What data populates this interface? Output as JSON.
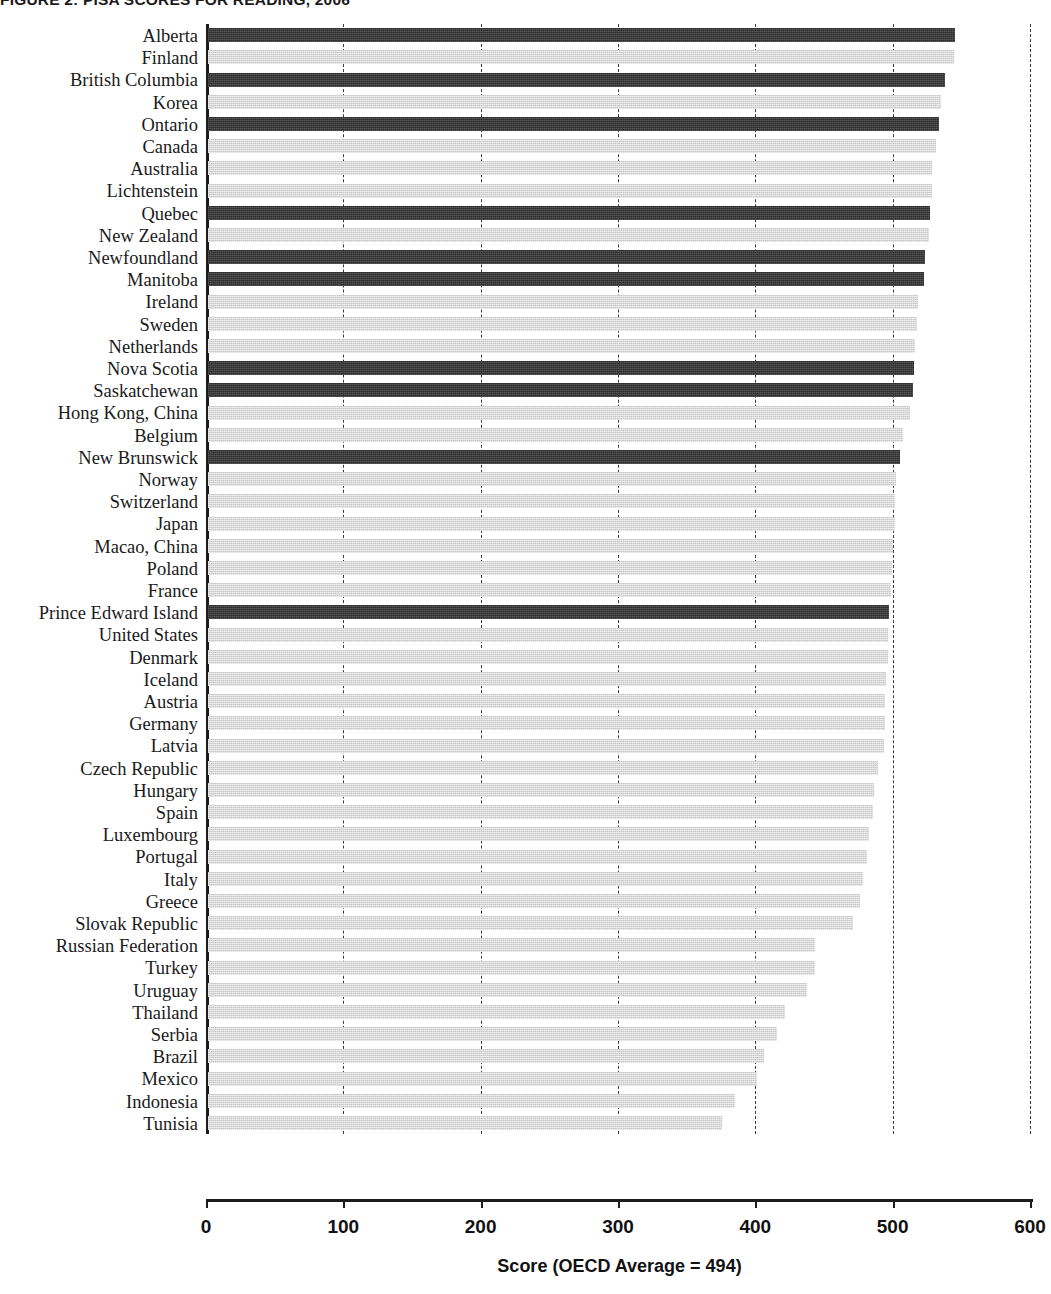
{
  "figure": {
    "title": "FIGURE 2: PISA SCORES FOR READING, 2006"
  },
  "axis": {
    "x_title": "Score (OECD Average = 494)",
    "tick_labels": [
      "0",
      "100",
      "200",
      "300",
      "400",
      "500",
      "600"
    ]
  },
  "legend": {
    "dark_series_name": "Canadian provinces",
    "light_series_name": "Countries / economies",
    "dark_color": "#2c2c2c",
    "light_color": "#c6c6c6"
  },
  "chart_data": {
    "type": "bar",
    "orientation": "horizontal",
    "title": "FIGURE 2: PISA SCORES FOR READING, 2006",
    "xlabel": "Score (OECD Average = 494)",
    "ylabel": "",
    "xlim": [
      0,
      600
    ],
    "xticks": [
      0,
      100,
      200,
      300,
      400,
      500,
      600
    ],
    "grid": true,
    "grid_axis": "x",
    "grid_style": "dashed",
    "legend_position": "none",
    "reference_value": 494,
    "reference_label": "OECD Average = 494",
    "categories": [
      "Alberta",
      "Finland",
      "British Columbia",
      "Korea",
      "Ontario",
      "Canada",
      "Australia",
      "Lichtenstein",
      "Quebec",
      "New Zealand",
      "Newfoundland",
      "Manitoba",
      "Ireland",
      "Sweden",
      "Netherlands",
      "Nova Scotia",
      "Saskatchewan",
      "Hong Kong, China",
      "Belgium",
      "New Brunswick",
      "Norway",
      "Switzerland",
      "Japan",
      "Macao, China",
      "Poland",
      "France",
      "Prince Edward Island",
      "United States",
      "Denmark",
      "Iceland",
      "Austria",
      "Germany",
      "Latvia",
      "Czech Republic",
      "Hungary",
      "Spain",
      "Luxembourg",
      "Portugal",
      "Italy",
      "Greece",
      "Slovak Republic",
      "Russian Federation",
      "Turkey",
      "Uruguay",
      "Thailand",
      "Serbia",
      "Brazil",
      "Mexico",
      "Indonesia",
      "Tunisia"
    ],
    "values": [
      544,
      543,
      537,
      534,
      532,
      530,
      527,
      527,
      526,
      525,
      522,
      521,
      517,
      516,
      515,
      514,
      513,
      511,
      506,
      504,
      501,
      500,
      500,
      499,
      498,
      497,
      496,
      495,
      495,
      494,
      493,
      493,
      492,
      488,
      485,
      484,
      481,
      480,
      477,
      475,
      470,
      442,
      442,
      436,
      420,
      414,
      405,
      400,
      384,
      374
    ],
    "series_group": [
      "dark",
      "light",
      "dark",
      "light",
      "dark",
      "light",
      "light",
      "light",
      "dark",
      "light",
      "dark",
      "dark",
      "light",
      "light",
      "light",
      "dark",
      "dark",
      "light",
      "light",
      "dark",
      "light",
      "light",
      "light",
      "light",
      "light",
      "light",
      "dark",
      "light",
      "light",
      "light",
      "light",
      "light",
      "light",
      "light",
      "light",
      "light",
      "light",
      "light",
      "light",
      "light",
      "light",
      "light",
      "light",
      "light",
      "light",
      "light",
      "light",
      "light",
      "light",
      "light"
    ]
  }
}
